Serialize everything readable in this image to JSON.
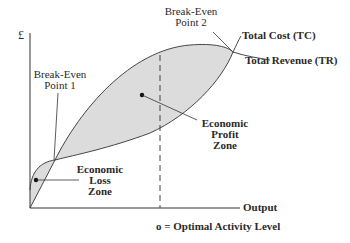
{
  "diagram": {
    "y_axis_label": "£",
    "x_axis_label": "Output",
    "optimal_label": "o = Optimal Activity Level",
    "break_even_1": {
      "line1": "Break-Even",
      "line2": "Point 1"
    },
    "break_even_2": {
      "line1": "Break-Even",
      "line2": "Point 2"
    },
    "total_cost_label": "Total Cost (TC)",
    "total_revenue_label": "Total Revenue (TR)",
    "profit_zone": {
      "line1": "Economic",
      "line2": "Profit",
      "line3": "Zone"
    },
    "loss_zone": {
      "line1": "Economic",
      "line2": "Loss",
      "line3": "Zone"
    },
    "colors": {
      "fill": "#dcdcdc",
      "line": "#333333",
      "text": "#2a2a2a"
    }
  }
}
